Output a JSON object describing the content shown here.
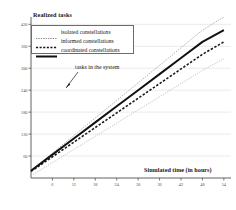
{
  "chart_data": {
    "type": "line",
    "title": "Realized tasks",
    "xlabel": "Simulated time (in hours)",
    "ylabel": "Realized tasks",
    "xlim": [
      0,
      56
    ],
    "ylim": [
      0,
      440
    ],
    "grid": true,
    "legend_position": "upper-left",
    "xticks": [
      6,
      12,
      18,
      24,
      30,
      36,
      42,
      48,
      54
    ],
    "yticks": [
      60,
      120,
      180,
      240,
      300,
      360,
      420
    ],
    "x": [
      0,
      6,
      12,
      18,
      24,
      30,
      36,
      42,
      48,
      54
    ],
    "series": [
      {
        "name": "isolated constellations",
        "style": "dotted-thin",
        "color": "#9a9795",
        "values": [
          20,
          68,
          116,
          164,
          212,
          260,
          308,
          356,
          404,
          440
        ]
      },
      {
        "name": "informed constellations",
        "style": "dashed",
        "color": "#1a1a1a",
        "values": [
          18,
          58,
          98,
          138,
          178,
          218,
          258,
          298,
          338,
          372
        ]
      },
      {
        "name": "coordinated constellations",
        "style": "solid-thick",
        "color": "#111111",
        "values": [
          20,
          64,
          108,
          152,
          196,
          240,
          284,
          328,
          372,
          404
        ]
      },
      {
        "name": "tasks in the system",
        "style": "dotted-light",
        "color": "#b5b2b0",
        "values": [
          6,
          42,
          78,
          114,
          150,
          186,
          222,
          258,
          294,
          326
        ]
      }
    ],
    "annotations": [
      {
        "text": "tasks in the system",
        "points_to": "tasks in the system"
      }
    ]
  },
  "legend": {
    "items": [
      {
        "label": "isolated constellations"
      },
      {
        "label": "informed constellations"
      },
      {
        "label": "coordinated constellations"
      }
    ]
  }
}
